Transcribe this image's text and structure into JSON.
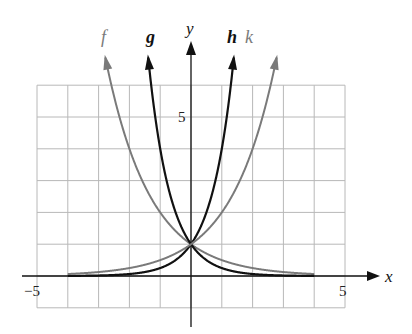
{
  "chart_data": {
    "type": "line",
    "title": "",
    "xlabel": "x",
    "ylabel": "y",
    "xlim": [
      -5,
      5
    ],
    "ylim": [
      -1,
      6
    ],
    "grid": true,
    "x_tick_labels": [
      {
        "value": -5,
        "label": "−5"
      },
      {
        "value": 5,
        "label": "5"
      }
    ],
    "y_tick_labels": [
      {
        "value": 5,
        "label": "5"
      }
    ],
    "domain": [
      -4,
      4
    ],
    "series": [
      {
        "name": "f",
        "expr": "2^(-x)",
        "color": "#7a7a7a",
        "label_bold": false
      },
      {
        "name": "g",
        "expr": "4^(-x)",
        "color": "#111111",
        "label_bold": true
      },
      {
        "name": "h",
        "expr": "4^x",
        "color": "#111111",
        "label_bold": true
      },
      {
        "name": "k",
        "expr": "2^x",
        "color": "#7a7a7a",
        "label_bold": false
      }
    ],
    "intersection": {
      "x": 0,
      "y": 1
    },
    "legend": "labels at curve arrow tips (f, g, h, k)"
  },
  "colors": {
    "grid": "#b8b8b8",
    "axis": "#111111",
    "gray_curve": "#7a7a7a",
    "dark_curve": "#111111"
  }
}
